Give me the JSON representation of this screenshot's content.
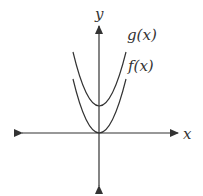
{
  "diagram": {
    "type": "function-graph",
    "axes": {
      "x_label": "x",
      "y_label": "y"
    },
    "curves": [
      {
        "name": "g",
        "label": "g(x)",
        "shape": "parabola",
        "vertex": "above origin"
      },
      {
        "name": "f",
        "label": "f(x)",
        "shape": "parabola",
        "vertex": "origin"
      }
    ],
    "colors": {
      "stroke": "#333333",
      "background": "#ffffff"
    }
  }
}
